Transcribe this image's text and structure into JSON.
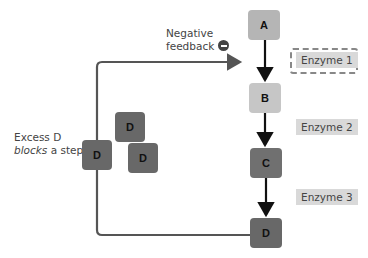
{
  "feedback_label": {
    "line1": "Negative",
    "line2": "feedback",
    "icon": "minus-circle-icon"
  },
  "pathway": {
    "steps": [
      {
        "label": "A",
        "color": "#b5b5b5"
      },
      {
        "label": "B",
        "color": "#c6c6c6"
      },
      {
        "label": "C",
        "color": "#707070"
      },
      {
        "label": "D",
        "color": "#686868"
      }
    ],
    "enzymes": [
      {
        "label": "Enzyme 1",
        "inhibited": true
      },
      {
        "label": "Enzyme 2",
        "inhibited": false
      },
      {
        "label": "Enzyme 3",
        "inhibited": false
      }
    ]
  },
  "excess": {
    "line1": "Excess D",
    "line2_italic": "blocks",
    "line2_rest": " a step.",
    "molecules": [
      "D",
      "D",
      "D"
    ],
    "color": "#686868"
  },
  "colors": {
    "line": "#555555",
    "arrow": "#111111",
    "enzyme_bg": "#d9d9d9"
  }
}
